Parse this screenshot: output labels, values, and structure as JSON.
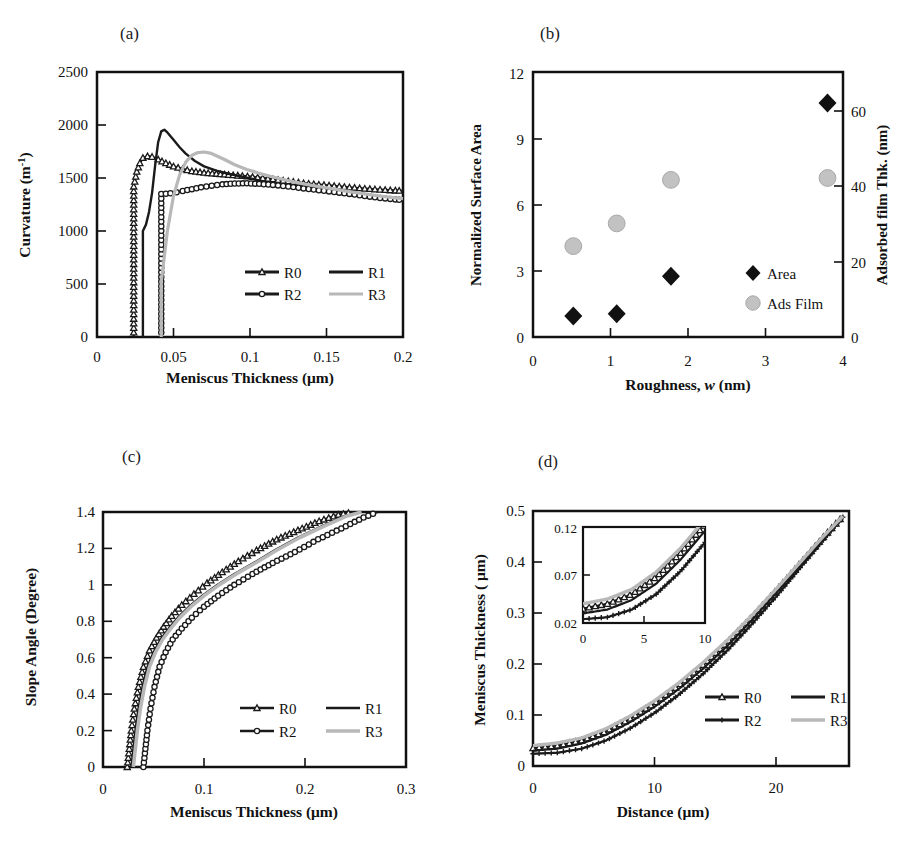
{
  "figure": {
    "panels": [
      "a",
      "b",
      "c",
      "d"
    ]
  },
  "panel_a": {
    "label": "(a)",
    "ylabel_main": "Curvature (m",
    "ylabel_sup": "-1",
    "ylabel_tail": ")",
    "xlabel": "Meniscus Thickness (μm)",
    "yticks": [
      "0",
      "500",
      "1000",
      "1500",
      "2000",
      "2500"
    ],
    "xticks": [
      "0",
      "0.05",
      "0.1",
      "0.15",
      "0.2"
    ],
    "legend": [
      {
        "name": "R0",
        "marker": "triangle",
        "color": "#1a1a1a"
      },
      {
        "name": "R1",
        "marker": "none",
        "color": "#1a1a1a"
      },
      {
        "name": "R2",
        "marker": "circle",
        "color": "#1a1a1a"
      },
      {
        "name": "R3",
        "marker": "none",
        "color": "#b8b8b8"
      }
    ]
  },
  "panel_b": {
    "label": "(b)",
    "ylabel_left": "Normalized Surface Area",
    "ylabel_right": "Adsorbed film Thk. (nm)",
    "xlabel_pre": "Roughness, ",
    "xlabel_it": "w",
    "xlabel_post": " (nm)",
    "yticks_left": [
      "0",
      "3",
      "6",
      "9",
      "12"
    ],
    "yticks_right": [
      "0",
      "20",
      "40",
      "60"
    ],
    "xticks": [
      "0",
      "1",
      "2",
      "3",
      "4"
    ],
    "legend": [
      {
        "name": "Area",
        "marker": "diamond",
        "color": "#111111"
      },
      {
        "name": "Ads Film",
        "marker": "circle",
        "color": "#c2c2c2"
      }
    ]
  },
  "panel_c": {
    "label": "(c)",
    "ylabel": "Slope Angle (Degree)",
    "xlabel": "Meniscus Thickness (μm)",
    "yticks": [
      "0",
      "0.2",
      "0.4",
      "0.6",
      "0.8",
      "1",
      "1.2",
      "1.4"
    ],
    "xticks": [
      "0",
      "0.1",
      "0.2",
      "0.3"
    ],
    "legend": [
      {
        "name": "R0",
        "marker": "triangle",
        "color": "#1a1a1a"
      },
      {
        "name": "R1",
        "marker": "none",
        "color": "#1a1a1a"
      },
      {
        "name": "R2",
        "marker": "circle",
        "color": "#1a1a1a"
      },
      {
        "name": "R3",
        "marker": "none",
        "color": "#b8b8b8"
      }
    ]
  },
  "panel_d": {
    "label": "(d)",
    "ylabel": "Meniscus Thickness ( μm)",
    "xlabel": "Distance (μm)",
    "yticks": [
      "0",
      "0.1",
      "0.2",
      "0.3",
      "0.4",
      "0.5"
    ],
    "xticks": [
      "0",
      "10",
      "20"
    ],
    "inset": {
      "yticks": [
        "0.02",
        "0.07",
        "0.12"
      ],
      "xticks": [
        "0",
        "5",
        "10"
      ]
    },
    "legend": [
      {
        "name": "R0",
        "marker": "triangle",
        "color": "#1a1a1a"
      },
      {
        "name": "R1",
        "marker": "none",
        "color": "#1a1a1a"
      },
      {
        "name": "R2",
        "marker": "cross",
        "color": "#1a1a1a"
      },
      {
        "name": "R3",
        "marker": "none",
        "color": "#b8b8b8"
      }
    ]
  },
  "chart_data": [
    {
      "id": "a",
      "type": "line",
      "title": "(a)",
      "xlabel": "Meniscus Thickness (μm)",
      "ylabel": "Curvature (m^-1)",
      "xlim": [
        0,
        0.2
      ],
      "ylim": [
        0,
        2500
      ],
      "xticks": [
        0,
        0.05,
        0.1,
        0.15,
        0.2
      ],
      "yticks": [
        0,
        500,
        1000,
        1500,
        2000,
        2500
      ],
      "grid": false,
      "legend_position": "lower-right-inside",
      "series": [
        {
          "name": "R0",
          "marker": "triangle",
          "color": "#1a1a1a",
          "x": [
            0.024,
            0.024,
            0.026,
            0.028,
            0.03,
            0.033,
            0.036,
            0.04,
            0.045,
            0.05,
            0.056,
            0.062,
            0.07,
            0.078,
            0.086,
            0.095,
            0.105,
            0.115,
            0.125,
            0.135,
            0.145,
            0.155,
            0.165,
            0.175,
            0.185,
            0.195,
            0.2
          ],
          "y": [
            0,
            1420,
            1560,
            1640,
            1690,
            1705,
            1700,
            1675,
            1640,
            1610,
            1585,
            1565,
            1550,
            1540,
            1530,
            1520,
            1505,
            1488,
            1470,
            1452,
            1438,
            1425,
            1412,
            1400,
            1390,
            1382,
            1378
          ]
        },
        {
          "name": "R1",
          "marker": "none",
          "color": "#1a1a1a",
          "x": [
            0.03,
            0.03,
            0.032,
            0.034,
            0.036,
            0.038,
            0.04,
            0.042,
            0.044,
            0.046,
            0.05,
            0.054,
            0.058,
            0.064,
            0.07,
            0.078,
            0.086,
            0.095,
            0.105,
            0.115,
            0.125,
            0.135,
            0.145,
            0.155,
            0.165,
            0.175,
            0.185,
            0.195,
            0.2
          ],
          "y": [
            0,
            1000,
            1060,
            1180,
            1360,
            1620,
            1840,
            1940,
            1955,
            1930,
            1860,
            1790,
            1730,
            1660,
            1610,
            1570,
            1540,
            1512,
            1480,
            1452,
            1425,
            1400,
            1378,
            1358,
            1340,
            1325,
            1312,
            1300,
            1295
          ]
        },
        {
          "name": "R2",
          "marker": "circle",
          "color": "#1a1a1a",
          "x": [
            0.042,
            0.042,
            0.045,
            0.048,
            0.052,
            0.056,
            0.062,
            0.068,
            0.075,
            0.082,
            0.09,
            0.098,
            0.106,
            0.115,
            0.125,
            0.135,
            0.145,
            0.155,
            0.165,
            0.175,
            0.185,
            0.195,
            0.2
          ],
          "y": [
            0,
            1350,
            1352,
            1356,
            1365,
            1378,
            1395,
            1412,
            1428,
            1440,
            1448,
            1450,
            1445,
            1435,
            1420,
            1402,
            1385,
            1368,
            1350,
            1330,
            1312,
            1298,
            1292
          ]
        },
        {
          "name": "R3",
          "marker": "none",
          "color": "#b8b8b8",
          "x": [
            0.042,
            0.042,
            0.046,
            0.05,
            0.054,
            0.058,
            0.062,
            0.066,
            0.07,
            0.074,
            0.078,
            0.084,
            0.09,
            0.098,
            0.106,
            0.115,
            0.125,
            0.135,
            0.145,
            0.155,
            0.165,
            0.175,
            0.185,
            0.195,
            0.2
          ],
          "y": [
            0,
            520,
            1000,
            1330,
            1530,
            1650,
            1715,
            1740,
            1745,
            1735,
            1710,
            1670,
            1625,
            1580,
            1545,
            1510,
            1475,
            1445,
            1418,
            1395,
            1372,
            1350,
            1330,
            1312,
            1305
          ]
        }
      ]
    },
    {
      "id": "b",
      "type": "scatter",
      "title": "(b)",
      "xlabel": "Roughness, w (nm)",
      "ylabel": "Normalized Surface Area",
      "ylabel_right": "Adsorbed film Thk. (nm)",
      "xlim": [
        0,
        4
      ],
      "ylim": [
        0,
        12
      ],
      "ylim_right": [
        0,
        70
      ],
      "xticks": [
        0,
        1,
        2,
        3,
        4
      ],
      "yticks": [
        0,
        3,
        6,
        9,
        12
      ],
      "yticks_right": [
        0,
        20,
        40,
        60
      ],
      "grid": false,
      "legend_position": "lower-right-inside",
      "series": [
        {
          "name": "Area",
          "marker": "diamond",
          "color": "#111111",
          "axis": "left",
          "x": [
            0.52,
            1.08,
            1.78,
            3.8
          ],
          "y": [
            0.95,
            1.05,
            2.75,
            10.6
          ]
        },
        {
          "name": "Ads Film",
          "marker": "circle",
          "color": "#c2c2c2",
          "axis": "right",
          "x": [
            0.52,
            1.08,
            1.78,
            3.8
          ],
          "y": [
            24.0,
            30.0,
            41.5,
            42.0
          ]
        }
      ]
    },
    {
      "id": "c",
      "type": "line",
      "title": "(c)",
      "xlabel": "Meniscus Thickness (μm)",
      "ylabel": "Slope Angle (Degree)",
      "xlim": [
        0,
        0.3
      ],
      "ylim": [
        0,
        1.4
      ],
      "xticks": [
        0,
        0.1,
        0.2,
        0.3
      ],
      "yticks": [
        0,
        0.2,
        0.4,
        0.6,
        0.8,
        1.0,
        1.2,
        1.4
      ],
      "grid": false,
      "legend_position": "lower-right-inside",
      "series": [
        {
          "name": "R0",
          "marker": "triangle",
          "color": "#1a1a1a",
          "x": [
            0.024,
            0.026,
            0.028,
            0.031,
            0.035,
            0.04,
            0.046,
            0.053,
            0.06,
            0.068,
            0.078,
            0.09,
            0.103,
            0.118,
            0.134,
            0.152,
            0.172,
            0.193,
            0.214,
            0.233,
            0.248
          ],
          "y": [
            0,
            0.1,
            0.2,
            0.32,
            0.44,
            0.55,
            0.64,
            0.71,
            0.77,
            0.83,
            0.89,
            0.95,
            1.01,
            1.07,
            1.13,
            1.19,
            1.25,
            1.3,
            1.35,
            1.385,
            1.4
          ]
        },
        {
          "name": "R1",
          "marker": "none",
          "color": "#1a1a1a",
          "x": [
            0.028,
            0.03,
            0.032,
            0.035,
            0.039,
            0.044,
            0.05,
            0.057,
            0.065,
            0.074,
            0.085,
            0.098,
            0.113,
            0.13,
            0.149,
            0.17,
            0.193,
            0.216,
            0.238,
            0.254
          ],
          "y": [
            0,
            0.1,
            0.2,
            0.32,
            0.44,
            0.55,
            0.63,
            0.7,
            0.76,
            0.82,
            0.88,
            0.94,
            1.0,
            1.06,
            1.12,
            1.19,
            1.26,
            1.32,
            1.375,
            1.4
          ]
        },
        {
          "name": "R2",
          "marker": "circle",
          "color": "#1a1a1a",
          "x": [
            0.04,
            0.042,
            0.044,
            0.047,
            0.051,
            0.056,
            0.062,
            0.069,
            0.078,
            0.088,
            0.1,
            0.114,
            0.13,
            0.148,
            0.168,
            0.19,
            0.213,
            0.236,
            0.258,
            0.272
          ],
          "y": [
            0,
            0.1,
            0.2,
            0.32,
            0.44,
            0.55,
            0.63,
            0.7,
            0.76,
            0.82,
            0.88,
            0.94,
            1.0,
            1.06,
            1.12,
            1.18,
            1.25,
            1.31,
            1.37,
            1.4
          ]
        },
        {
          "name": "R3",
          "marker": "none",
          "color": "#b8b8b8",
          "x": [
            0.03,
            0.032,
            0.034,
            0.037,
            0.041,
            0.046,
            0.052,
            0.059,
            0.067,
            0.076,
            0.087,
            0.1,
            0.115,
            0.132,
            0.151,
            0.172,
            0.195,
            0.218,
            0.24,
            0.256
          ],
          "y": [
            0,
            0.1,
            0.2,
            0.32,
            0.44,
            0.55,
            0.63,
            0.7,
            0.76,
            0.82,
            0.88,
            0.94,
            1.0,
            1.06,
            1.12,
            1.19,
            1.26,
            1.32,
            1.375,
            1.4
          ]
        }
      ]
    },
    {
      "id": "d",
      "type": "line",
      "title": "(d)",
      "xlabel": "Distance (μm)",
      "ylabel": "Meniscus Thickness ( μm)",
      "xlim": [
        0,
        26
      ],
      "ylim": [
        0,
        0.5
      ],
      "xticks": [
        0,
        10,
        20
      ],
      "yticks": [
        0,
        0.1,
        0.2,
        0.3,
        0.4,
        0.5
      ],
      "grid": false,
      "legend_position": "lower-right-inside",
      "inset": {
        "xlim": [
          0,
          10
        ],
        "ylim": [
          0.02,
          0.12
        ],
        "xticks": [
          0,
          5,
          10
        ],
        "yticks": [
          0.02,
          0.07,
          0.12
        ]
      },
      "series": [
        {
          "name": "R0",
          "marker": "triangle",
          "color": "#1a1a1a",
          "x": [
            0,
            2,
            4,
            6,
            8,
            10,
            12,
            14,
            16,
            18,
            20,
            22,
            24,
            25.5
          ],
          "y": [
            0.035,
            0.04,
            0.05,
            0.068,
            0.093,
            0.123,
            0.158,
            0.198,
            0.243,
            0.292,
            0.344,
            0.398,
            0.452,
            0.49
          ]
        },
        {
          "name": "R1",
          "marker": "none",
          "color": "#1a1a1a",
          "x": [
            0,
            2,
            4,
            6,
            8,
            10,
            12,
            14,
            16,
            18,
            20,
            22,
            24,
            25.5
          ],
          "y": [
            0.03,
            0.034,
            0.044,
            0.061,
            0.086,
            0.116,
            0.151,
            0.191,
            0.236,
            0.286,
            0.339,
            0.394,
            0.45,
            0.49
          ]
        },
        {
          "name": "R2",
          "marker": "cross",
          "color": "#1a1a1a",
          "x": [
            0,
            2,
            4,
            6,
            8,
            10,
            12,
            14,
            16,
            18,
            20,
            22,
            24,
            25.5
          ],
          "y": [
            0.024,
            0.026,
            0.034,
            0.05,
            0.074,
            0.104,
            0.14,
            0.181,
            0.227,
            0.278,
            0.332,
            0.389,
            0.446,
            0.488
          ]
        },
        {
          "name": "R3",
          "marker": "none",
          "color": "#b8b8b8",
          "x": [
            0,
            2,
            4,
            6,
            8,
            10,
            12,
            14,
            16,
            18,
            20,
            22,
            24,
            25.5
          ],
          "y": [
            0.04,
            0.045,
            0.055,
            0.073,
            0.098,
            0.128,
            0.163,
            0.203,
            0.247,
            0.295,
            0.347,
            0.4,
            0.453,
            0.49
          ]
        }
      ]
    }
  ]
}
